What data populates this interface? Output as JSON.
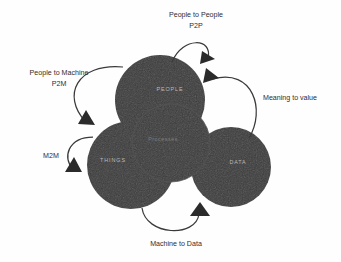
{
  "diagram": {
    "colors": {
      "circle_fill": "#3b3b3b",
      "circle_label": "#b9b9b9",
      "center_label": "#7e7e7e",
      "arrow": "#2b2b2b",
      "flow_label": "#2e2e2e",
      "background": "#fefefe"
    },
    "nodes": [
      {
        "id": "people",
        "label": "PEOPLE",
        "position": "top"
      },
      {
        "id": "things",
        "label": "THINGS",
        "position": "left"
      },
      {
        "id": "data",
        "label": "DATA",
        "position": "right"
      },
      {
        "id": "processes",
        "label": "Processes",
        "position": "center"
      }
    ],
    "flows": [
      {
        "id": "p2p",
        "label_line1": "People to People",
        "label_line2": "P2P",
        "from": "people",
        "to": "people",
        "position": "top"
      },
      {
        "id": "p2m",
        "label_line1": "People to Machine",
        "label_line2": "P2M",
        "from": "people",
        "to": "things",
        "position": "top-left"
      },
      {
        "id": "m2m",
        "label_line1": "M2M",
        "label_line2": "",
        "from": "things",
        "to": "things",
        "position": "left"
      },
      {
        "id": "machine-to-data",
        "label_line1": "Machine to Data",
        "label_line2": "",
        "from": "things",
        "to": "data",
        "position": "bottom"
      },
      {
        "id": "meaning-to-value",
        "label_line1": "Meaning to value",
        "label_line2": "",
        "from": "data",
        "to": "people",
        "position": "right"
      }
    ]
  }
}
